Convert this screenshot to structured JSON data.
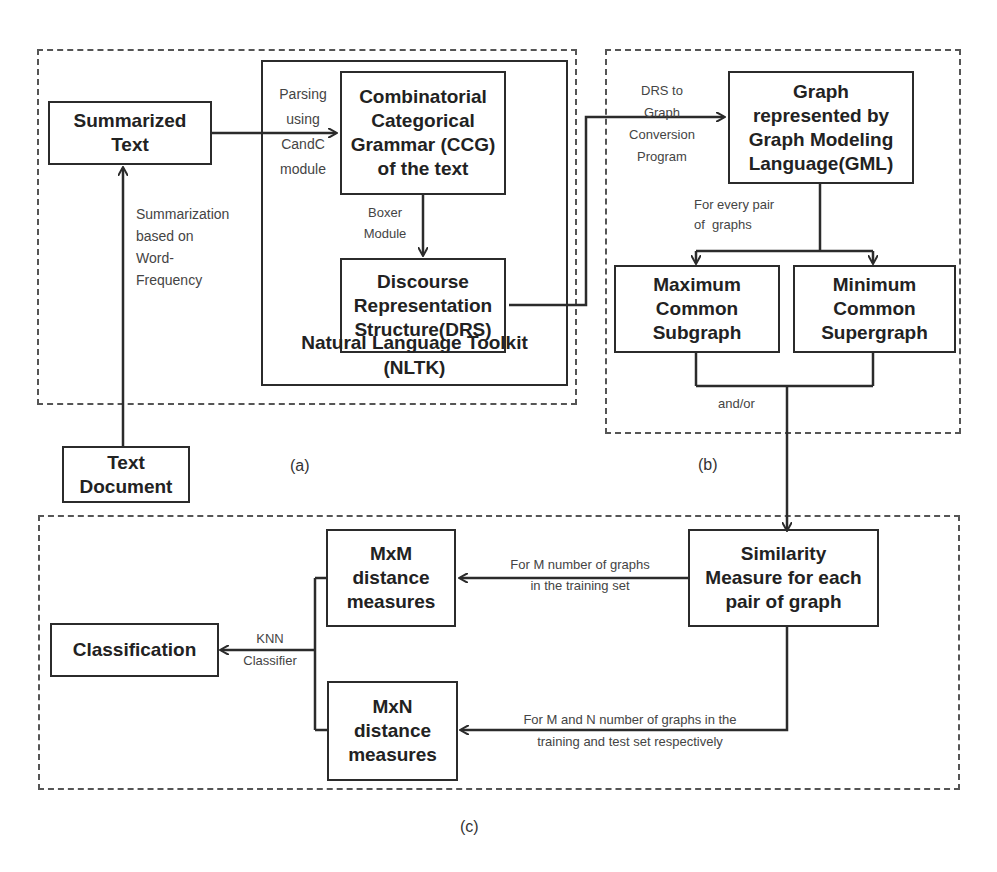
{
  "figure": {
    "panels": {
      "a": {
        "caption": "(a)",
        "boxes": {
          "summarized_text": [
            "Summarized",
            "Text"
          ],
          "text_document": [
            "Text",
            "Document"
          ],
          "ccg": [
            "Combinatorial",
            "Categorical",
            "Grammar (CCG)",
            "of the text"
          ],
          "drs": [
            "Discourse",
            "Representation",
            "Structure(DRS)"
          ],
          "nltk": [
            "Natural Language Toolkit",
            "(NLTK)"
          ]
        },
        "edge_labels": {
          "parsing": [
            "Parsing",
            "using",
            "CandC",
            "module"
          ],
          "summarization": [
            "Summarization",
            "based on",
            "Word-",
            "Frequency"
          ],
          "boxer": [
            "Boxer",
            "Module"
          ]
        }
      },
      "b": {
        "caption": "(b)",
        "boxes": {
          "gml": [
            "Graph",
            "represented by",
            "Graph Modeling",
            "Language(GML)"
          ],
          "mcs": [
            "Maximum",
            "Common",
            "Subgraph"
          ],
          "mcsup": [
            "Minimum",
            "Common",
            "Supergraph"
          ]
        },
        "edge_labels": {
          "drs_to_graph": [
            "DRS to",
            "Graph",
            "Conversion",
            "Program"
          ],
          "every_pair": [
            "For every pair",
            "of  graphs"
          ],
          "and_or": "and/or"
        }
      },
      "c": {
        "caption": "(c)",
        "boxes": {
          "similarity": [
            "Similarity",
            "Measure for each",
            "pair of graph"
          ],
          "mxm": [
            "MxM",
            "distance",
            "measures"
          ],
          "mxn": [
            "MxN",
            "distance",
            "measures"
          ],
          "classification": "Classification"
        },
        "edge_labels": {
          "m_graphs": [
            "For M number of graphs",
            "in the training set"
          ],
          "mn_graphs": [
            "For M and N number of graphs in the",
            "training and test set respectively"
          ],
          "knn": [
            "KNN",
            "Classifier"
          ]
        }
      }
    },
    "colors": {
      "stroke": "#2b2b2b",
      "dash": "#555555",
      "label": "#444444"
    }
  }
}
